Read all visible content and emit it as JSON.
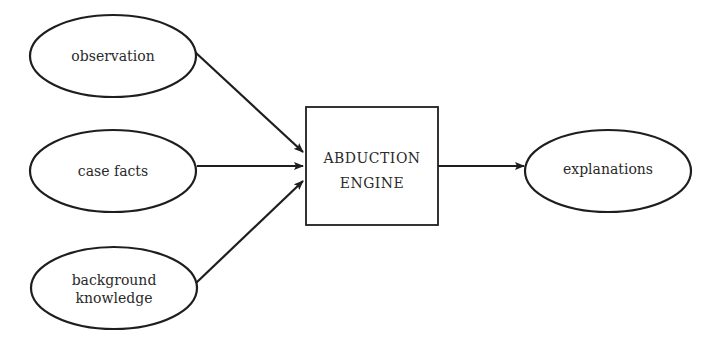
{
  "diagram": {
    "inputs": [
      {
        "id": "observation",
        "lines": [
          "observation"
        ]
      },
      {
        "id": "case-facts",
        "lines": [
          "case facts"
        ]
      },
      {
        "id": "background-knowledge",
        "lines": [
          "background",
          "knowledge"
        ]
      }
    ],
    "engine": {
      "lines": [
        "ABDUCTION",
        "ENGINE"
      ]
    },
    "output": {
      "id": "explanations",
      "lines": [
        "explanations"
      ]
    },
    "edges": [
      {
        "from": "observation",
        "to": "abduction-engine"
      },
      {
        "from": "case-facts",
        "to": "abduction-engine"
      },
      {
        "from": "background-knowledge",
        "to": "abduction-engine"
      },
      {
        "from": "abduction-engine",
        "to": "explanations"
      }
    ],
    "colors": {
      "stroke": "#1e1e1e",
      "text": "#2a2a2a",
      "background": "#ffffff"
    }
  }
}
